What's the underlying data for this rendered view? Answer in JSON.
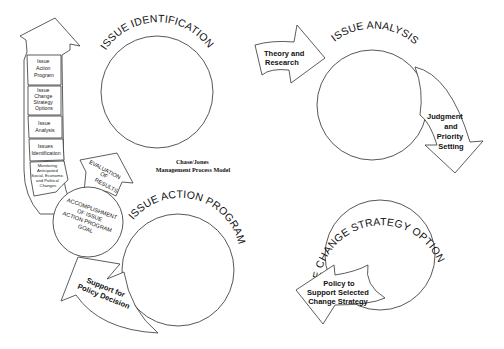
{
  "caption": {
    "line1": "Chase/Jones",
    "line2": "Management Process Model"
  },
  "stages": [
    {
      "id": "identification",
      "title": "ISSUE IDENTIFICATION"
    },
    {
      "id": "analysis",
      "title": "ISSUE ANALYSIS"
    },
    {
      "id": "change_strategy",
      "title": "ISSUE CHANGE STRATEGY OPTIONS"
    },
    {
      "id": "action_program",
      "title": "ISSUE ACTION PROGRAM"
    }
  ],
  "arrows": {
    "theory": {
      "line1": "Theory and",
      "line2": "Research"
    },
    "judgment": {
      "line1": "Judgment",
      "line2": "and",
      "line3": "Priority",
      "line4": "Setting"
    },
    "policy": {
      "line1": "Policy to",
      "line2": "Support Selected",
      "line3": "Change Strategy"
    },
    "support": {
      "line1": "Support for",
      "line2": "Policy Decision"
    },
    "evaluation": {
      "line1": "EVALUATION",
      "line2": "OF",
      "line3": "RESULTS"
    }
  },
  "accomplishment": {
    "line1": "ACCOMPLISHMENT",
    "line2": "OF ISSUE",
    "line3": "ACTION PROGRAM",
    "line4": "GOAL"
  },
  "left_column": {
    "boxes": [
      {
        "lines": [
          "Issue",
          "Action",
          "Program"
        ]
      },
      {
        "lines": [
          "Issue",
          "Change",
          "Strategy",
          "Options"
        ]
      },
      {
        "lines": [
          "Issue",
          "Analysis"
        ]
      },
      {
        "lines": [
          "Issues",
          "Identification"
        ]
      },
      {
        "lines": [
          "Monitoring",
          "Anticipated",
          "Social, Economic",
          "and Political",
          "Changes"
        ]
      }
    ]
  }
}
